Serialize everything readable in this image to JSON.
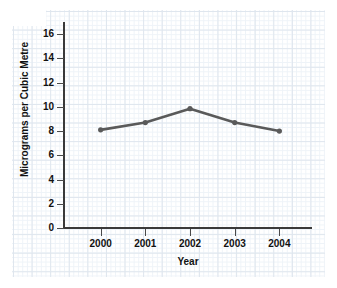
{
  "chart_data": {
    "type": "line",
    "title": "",
    "xlabel": "Year",
    "ylabel": "Micrograms per Cubic Metre",
    "categories": [
      "2000",
      "2001",
      "2002",
      "2003",
      "2004"
    ],
    "x": [
      2000,
      2001,
      2002,
      2003,
      2004
    ],
    "values": [
      8.1,
      8.7,
      9.85,
      8.7,
      8.0
    ],
    "series": [
      {
        "name": "Micrograms per Cubic Metre",
        "values": [
          8.1,
          8.7,
          9.85,
          8.7,
          8.0
        ]
      }
    ],
    "ylim": [
      0,
      17
    ],
    "xlim": [
      1999.6,
      2004.6
    ],
    "ytick_labels": [
      "0",
      "2",
      "4",
      "6",
      "8",
      "10",
      "12",
      "14",
      "16"
    ],
    "ytick_values": [
      0,
      2,
      4,
      6,
      8,
      10,
      12,
      14,
      16
    ],
    "xtick_labels": [
      "2000",
      "2001",
      "2002",
      "2003",
      "2004"
    ],
    "grid": true,
    "grid_style": "graph-paper",
    "legend": false,
    "legend_position": "none",
    "marker": "circle",
    "line_color": "#5a5a5a",
    "marker_color": "#5a5a5a",
    "grid_color": "#dfe6ee",
    "axis_color": "#3a3a3a",
    "text_color": "#111111",
    "background_color": "#ffffff"
  }
}
